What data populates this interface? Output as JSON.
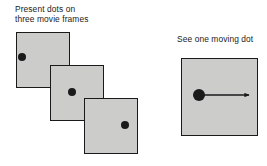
{
  "figure": {
    "type": "diagram",
    "background_color": "#ffffff",
    "frame_fill_color": "#ccccca",
    "stroke_color": "#1a1a1a"
  },
  "left_panel": {
    "caption": "Present dots on\nthree movie frames",
    "frames": [
      {
        "label": "movie-frame-1",
        "x": 16,
        "y": 32,
        "width": 54,
        "height": 56,
        "dot": {
          "cx": 22,
          "cy": 57,
          "r": 4.2
        }
      },
      {
        "label": "movie-frame-2",
        "x": 50,
        "y": 65,
        "width": 54,
        "height": 56,
        "dot": {
          "cx": 72,
          "cy": 92,
          "r": 4.2
        }
      },
      {
        "label": "movie-frame-3",
        "x": 84,
        "y": 98,
        "width": 54,
        "height": 56,
        "dot": {
          "cx": 125,
          "cy": 125,
          "r": 4.2
        }
      }
    ]
  },
  "right_panel": {
    "caption": "See one moving dot",
    "panel": {
      "x": 181,
      "y": 58,
      "width": 77,
      "height": 78
    },
    "dot": {
      "cx": 199,
      "cy": 95,
      "r": 6.2
    },
    "arrow": {
      "x1": 199,
      "y1": 95,
      "x2": 249,
      "y2": 95,
      "head": "right"
    }
  }
}
